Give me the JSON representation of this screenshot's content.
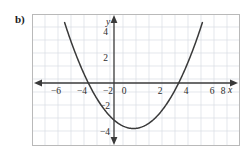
{
  "figure": {
    "part_label": "b)",
    "background_color": "#ffffff",
    "border_color": "#b9b9b9",
    "grid_color": "#d9dde4",
    "axis_color": "#3a3a3a",
    "curve_color": "#3a3a3a"
  },
  "axes": {
    "x_axis_name": "x",
    "y_axis_name": "y",
    "x_tick_labels": [
      "−6",
      "−4",
      "−2",
      "2",
      "4",
      "6",
      "8"
    ],
    "y_tick_labels": [
      "4",
      "2",
      "−2",
      "−4"
    ],
    "origin_label": "0"
  },
  "chart_data": {
    "type": "line",
    "title": "",
    "xlabel": "x",
    "ylabel": "y",
    "xlim": [
      -7,
      9
    ],
    "ylim": [
      -5.3,
      4.8
    ],
    "grid": true,
    "legend": null,
    "xticks": [
      -6,
      -4,
      -2,
      0,
      2,
      4,
      6,
      8
    ],
    "yticks": [
      4,
      2,
      0,
      -2,
      -4
    ],
    "xtick_labels": [
      "−6",
      "−4",
      "−2",
      "0",
      "2",
      "4",
      "6",
      "8"
    ],
    "ytick_labels": [
      "4",
      "2",
      "0",
      "−2",
      "−4"
    ],
    "grid_step": 1,
    "series": [
      {
        "name": "parabola",
        "kind": "quadratic",
        "equation": "y = 0.29(x + 2)(x - 5)",
        "a": 0.29,
        "vertex": [
          1.5,
          -3.5
        ],
        "roots": [
          -2,
          5
        ],
        "y_intercept": -2.9,
        "x": [
          -3.6,
          -3.2,
          -2.8,
          -2.4,
          -2.0,
          -1.6,
          -1.2,
          -0.8,
          -0.4,
          0.0,
          0.4,
          0.8,
          1.2,
          1.6,
          2.0,
          2.4,
          2.8,
          3.2,
          3.6,
          4.0,
          4.4,
          4.8,
          5.2,
          5.6,
          6.0,
          6.4,
          6.8
        ],
        "y": [
          4.51,
          3.38,
          2.33,
          1.37,
          0.49,
          -0.3,
          -1.01,
          -1.63,
          -2.17,
          -2.63,
          -3.0,
          -3.29,
          -3.49,
          -3.61,
          -3.65,
          -3.6,
          -3.47,
          -3.26,
          -2.96,
          -2.58,
          -2.12,
          -1.58,
          -0.95,
          -0.24,
          0.55,
          1.43,
          2.39
        ]
      }
    ]
  }
}
